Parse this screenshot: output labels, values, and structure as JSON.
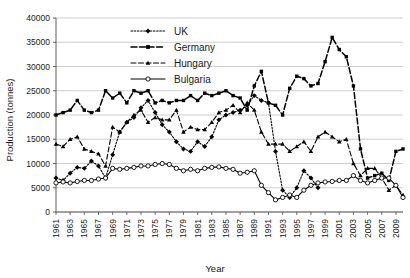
{
  "chart_data": {
    "type": "line",
    "title": "",
    "xlabel": "Year",
    "ylabel": "Production (tonnes)",
    "ylim": [
      0,
      40000
    ],
    "ytick_labels": [
      "0",
      "5000",
      "10000",
      "15000",
      "20000",
      "25000",
      "30000",
      "35000",
      "40000"
    ],
    "ytick_values": [
      0,
      5000,
      10000,
      15000,
      20000,
      25000,
      30000,
      35000,
      40000
    ],
    "grid": true,
    "legend_position": "top-center",
    "x": [
      1961,
      1962,
      1963,
      1964,
      1965,
      1966,
      1967,
      1968,
      1969,
      1970,
      1971,
      1972,
      1973,
      1974,
      1975,
      1976,
      1977,
      1978,
      1979,
      1980,
      1981,
      1982,
      1983,
      1984,
      1985,
      1986,
      1987,
      1988,
      1989,
      1990,
      1991,
      1992,
      1993,
      1994,
      1995,
      1996,
      1997,
      1998,
      1999,
      2000,
      2001,
      2002,
      2003,
      2004,
      2005,
      2006,
      2007,
      2008,
      2009,
      2010
    ],
    "xtick_labels": [
      "1961",
      "1963",
      "1965",
      "1967",
      "1969",
      "1971",
      "1973",
      "1975",
      "1977",
      "1979",
      "1981",
      "1983",
      "1985",
      "1987",
      "1989",
      "1991",
      "1993",
      "1995",
      "1997",
      "1999",
      "2001",
      "2003",
      "2005",
      "2007",
      "2009"
    ],
    "series": [
      {
        "name": "UK",
        "color": "#000000",
        "marker": "diamond",
        "dash": "1.6,1.6",
        "values": [
          7000,
          6500,
          8000,
          9200,
          9000,
          10500,
          9500,
          7000,
          11800,
          16500,
          18500,
          19500,
          21500,
          23000,
          20500,
          18000,
          16500,
          14500,
          13000,
          12500,
          14500,
          13500,
          15500,
          19000,
          20000,
          20500,
          21000,
          22000,
          24000,
          23000,
          22500,
          12500,
          4500,
          3000,
          5000,
          8500,
          7000,
          5000,
          null,
          null,
          null,
          null,
          null,
          null,
          null,
          null,
          null,
          null,
          null,
          null
        ]
      },
      {
        "name": "Germany",
        "color": "#000000",
        "marker": "square",
        "dash": "6,2.5",
        "values": [
          20000,
          20500,
          21000,
          23000,
          21000,
          20500,
          21000,
          25000,
          23500,
          24500,
          22500,
          25000,
          24500,
          25000,
          22500,
          23000,
          22500,
          23000,
          23000,
          24000,
          23000,
          24500,
          24000,
          24500,
          25000,
          24000,
          23500,
          21000,
          26000,
          29000,
          22500,
          22000,
          20000,
          25500,
          28000,
          27500,
          26000,
          26500,
          31000,
          36000,
          33500,
          32000,
          26000,
          13000,
          7000,
          7500,
          8000,
          6500,
          12500,
          13000
        ]
      },
      {
        "name": "Hungary",
        "color": "#000000",
        "marker": "triangle",
        "dash": "5,2.5",
        "values": [
          14000,
          13500,
          15000,
          15500,
          13000,
          12500,
          12000,
          9500,
          17500,
          16500,
          18500,
          20000,
          21000,
          18500,
          19500,
          19000,
          19000,
          21000,
          16500,
          17500,
          17000,
          17000,
          18500,
          20500,
          21000,
          22000,
          20500,
          22500,
          21000,
          16500,
          14000,
          14000,
          14000,
          12500,
          13500,
          14500,
          12500,
          15500,
          16500,
          15500,
          14500,
          15000,
          10000,
          7500,
          9000,
          9000,
          7000,
          4500,
          5500,
          3500
        ]
      },
      {
        "name": "Bulgaria",
        "color": "#000000",
        "marker": "circle-open",
        "dash": "0",
        "values": [
          6000,
          6200,
          6000,
          6300,
          6500,
          6500,
          6800,
          7000,
          9000,
          8800,
          9000,
          9200,
          9500,
          9500,
          9800,
          10000,
          9800,
          9000,
          8500,
          8800,
          8500,
          9000,
          9200,
          9300,
          9000,
          8800,
          8000,
          8200,
          8500,
          5500,
          4000,
          2500,
          3000,
          3500,
          3000,
          4500,
          5500,
          6000,
          6200,
          6300,
          6500,
          6500,
          7500,
          6500,
          6000,
          6500,
          7000,
          7000,
          5500,
          3000
        ]
      }
    ],
    "legend": [
      {
        "label": "UK",
        "marker": "diamond",
        "dash": "1.6,1.6"
      },
      {
        "label": "Germany",
        "marker": "square",
        "dash": "6,2.5"
      },
      {
        "label": "Hungary",
        "marker": "triangle",
        "dash": "5,2.5"
      },
      {
        "label": "Bulgaria",
        "marker": "circle-open",
        "dash": "0"
      }
    ]
  }
}
